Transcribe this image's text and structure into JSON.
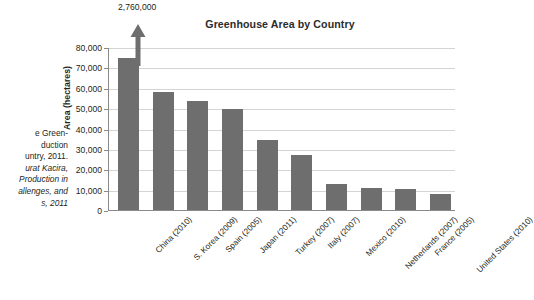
{
  "caption": {
    "lines": [
      "e Green-",
      "duction",
      "untry, 2011.",
      "urat Kacira,",
      "Production in",
      "allenges, and",
      "s, 2011"
    ],
    "italic_from_index": 3
  },
  "chart_data": {
    "type": "bar",
    "title": "Greenhouse Area by Country",
    "xlabel": "",
    "ylabel": "Area (hectares)",
    "ylim": [
      0,
      80000
    ],
    "ytick_labels": [
      "0",
      "10,000",
      "20,000",
      "30,000",
      "40,000",
      "50,000",
      "60,000",
      "70,000",
      "80,000"
    ],
    "ytick_values": [
      0,
      10000,
      20000,
      30000,
      40000,
      50000,
      60000,
      70000,
      80000
    ],
    "grid": true,
    "legend": "none",
    "categories": [
      "China (2010)",
      "S. Korea (2009)",
      "Spain (2005)",
      "Japan (2011)",
      "Turkey (2007)",
      "Italy (2007)",
      "Mexico (2010)",
      "Netherlands (2007)",
      "France (2005)",
      "United States (2010)"
    ],
    "values": [
      2760000,
      58500,
      54000,
      50000,
      35000,
      27500,
      13500,
      11500,
      11000,
      8500
    ],
    "bar_color": "#6e6e6e",
    "grid_color": "#d4d4d4",
    "axis_color": "#8a8a8a",
    "annotations": [
      {
        "label": "2,760,000",
        "category": "China (2010)",
        "note": "broken-axis arrow; bar clipped at top of plot"
      }
    ],
    "axis_break": {
      "category": "China (2010)",
      "clipped_at": 75000,
      "arrow": "up"
    }
  }
}
